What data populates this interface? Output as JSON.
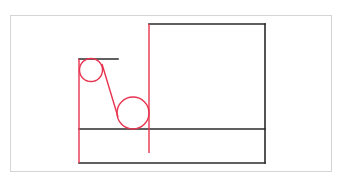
{
  "diagram": {
    "type": "mechanical-schematic",
    "colors": {
      "structure": "#2b2b2b",
      "belt": "#e8334f",
      "frame": "#d4d4d4"
    },
    "frame": {
      "x": 10,
      "y": 15,
      "w": 322,
      "h": 157
    },
    "black_lines": [
      {
        "name": "top-short-bar",
        "x1": 79,
        "y1": 59,
        "x2": 118,
        "y2": 59
      },
      {
        "name": "box-top",
        "x1": 149,
        "y1": 24,
        "x2": 265,
        "y2": 24
      },
      {
        "name": "box-right",
        "x1": 265,
        "y1": 24,
        "x2": 265,
        "y2": 163
      },
      {
        "name": "middle-floor",
        "x1": 79,
        "y1": 129,
        "x2": 265,
        "y2": 129
      },
      {
        "name": "bottom-floor",
        "x1": 79,
        "y1": 163,
        "x2": 265,
        "y2": 163
      }
    ],
    "red_lines": [
      {
        "name": "left-vertical",
        "x1": 79,
        "y1": 59,
        "x2": 79,
        "y2": 163
      },
      {
        "name": "belt-slant",
        "x1": 102,
        "y1": 64,
        "x2": 118,
        "y2": 117
      },
      {
        "name": "right-vertical",
        "x1": 149,
        "y1": 24,
        "x2": 149,
        "y2": 153
      }
    ],
    "pulleys": [
      {
        "name": "small-pulley",
        "cx": 91,
        "cy": 70,
        "r": 11.5
      },
      {
        "name": "large-pulley",
        "cx": 133,
        "cy": 113,
        "r": 16
      }
    ]
  }
}
